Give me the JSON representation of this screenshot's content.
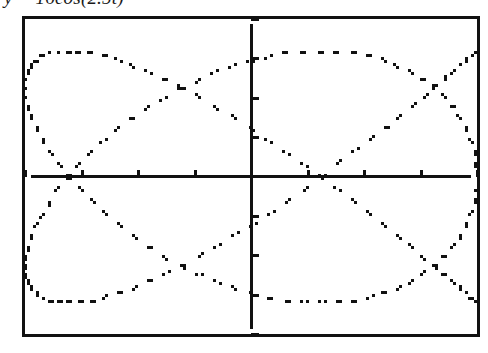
{
  "caption": {
    "text": "y = 16cos(2.5t)",
    "lhs": "y",
    "equals": "=",
    "amplitude": "16",
    "function": "cos",
    "frequency": "2.5",
    "variable": "t"
  },
  "screen": {
    "name": "graphing-calculator-screen",
    "border_color": "#111111",
    "background_color": "#ffffff",
    "curve_color": "#111111",
    "axis_color": "#111111"
  },
  "chart_data": {
    "type": "line",
    "title": "y = 16cos(2.5t)",
    "subtype": "lissajous-parametric",
    "xlabel": "",
    "ylabel": "",
    "grid": false,
    "legend": null,
    "axes": {
      "x_axis_y_value": 0,
      "y_axis_x_value": 0,
      "xlim": [
        -10,
        10
      ],
      "ylim": [
        -20,
        20
      ],
      "x_tick_step": 2.5,
      "y_tick_step": 5,
      "x_ticks": [
        -10,
        -7.5,
        -5,
        -2.5,
        0,
        2.5,
        5,
        7.5,
        10
      ],
      "y_ticks": [
        -20,
        -15,
        -10,
        -5,
        0,
        5,
        10,
        15,
        20
      ],
      "tick_labels_shown": false
    },
    "parametric": {
      "x_expression": "10cos(2t)",
      "y_expression": "16cos(2.5t)",
      "x_amplitude": 10,
      "x_frequency": 2,
      "y_amplitude": 16,
      "y_frequency": 2.5,
      "t_min": 0,
      "t_max": 12.566,
      "t_step": 0.0393
    },
    "curve_extent": {
      "x_min": -9.4,
      "x_max": 9.4,
      "y_min": -16,
      "y_max": 16
    }
  }
}
